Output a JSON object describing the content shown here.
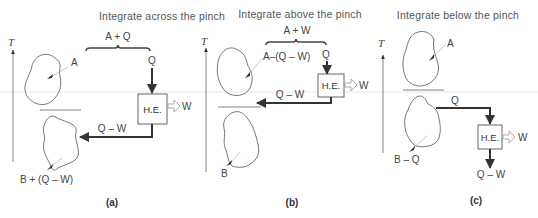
{
  "panels": [
    {
      "title": "Integrate across the pinch",
      "caption": "(a)",
      "axis_label": "T",
      "top_label": "A",
      "bracket_label": "A + Q",
      "heat_in_label": "Q",
      "engine_label": "H.E.",
      "work_label": "W",
      "reject_label": "Q – W",
      "bottom_label": "B + (Q – W)"
    },
    {
      "title": "Integrate above the pinch",
      "caption": "(b)",
      "axis_label": "T",
      "top_label": "A–(Q – W)",
      "bracket_label": "A + W",
      "heat_in_label": "Q",
      "engine_label": "H.E.",
      "work_label": "W",
      "reject_label": "Q – W",
      "bottom_label": "B"
    },
    {
      "title": "Integrate below the pinch",
      "caption": "(c)",
      "axis_label": "T",
      "top_label": "A",
      "heat_in_label": "Q",
      "engine_label": "H.E.",
      "work_label": "W",
      "reject_label": "Q – W",
      "bottom_label": "B – Q"
    }
  ]
}
